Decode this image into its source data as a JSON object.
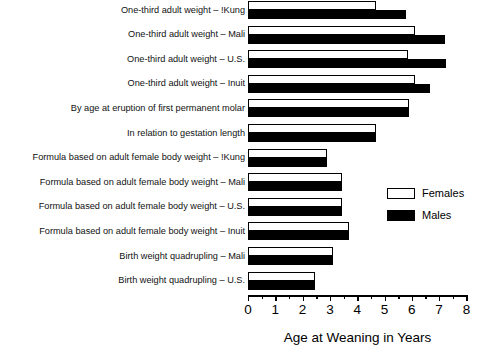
{
  "chart_data": {
    "type": "bar",
    "orientation": "horizontal",
    "title": "",
    "xlabel": "Age at Weaning in Years",
    "ylabel": "",
    "xlim": [
      0,
      8
    ],
    "xticks": [
      0,
      1,
      2,
      3,
      4,
      5,
      6,
      7,
      8
    ],
    "xtick_labels": [
      "0",
      "1",
      "2",
      "3",
      "4",
      "5",
      "6",
      "7",
      "8"
    ],
    "minor_tick_step": 0.5,
    "grid": false,
    "legend_position": "center right",
    "categories": [
      "One-third adult weight – !Kung",
      "One-third adult weight – Mali",
      "One-third adult weight – U.S.",
      "One-third adult weight – Inuit",
      "By age at eruption of first permanent molar",
      "In relation to gestation length",
      "Formula based on adult female body weight – !Kung",
      "Formula based on adult female body weight – Mali",
      "Formula based on adult female body weight – U.S.",
      "Formula based on adult female body weight – Inuit",
      "Birth weight quadrupling – Mali",
      "Birth weight quadrupling – U.S."
    ],
    "series": [
      {
        "name": "Females",
        "color": "#ffffff",
        "values": [
          4.7,
          6.1,
          5.85,
          6.1,
          5.9,
          4.7,
          2.9,
          3.45,
          3.45,
          3.7,
          3.1,
          2.45
        ]
      },
      {
        "name": "Males",
        "color": "#000000",
        "values": [
          5.8,
          7.2,
          7.25,
          6.65,
          5.9,
          4.7,
          2.9,
          3.45,
          3.45,
          3.7,
          3.1,
          2.45
        ]
      }
    ]
  },
  "legend": {
    "items": [
      {
        "label": "Females",
        "swatch": "white-bar-swatch"
      },
      {
        "label": "Males",
        "swatch": "black-bar-swatch"
      }
    ]
  },
  "axis": {
    "x_title": "Age at Weaning in Years"
  }
}
